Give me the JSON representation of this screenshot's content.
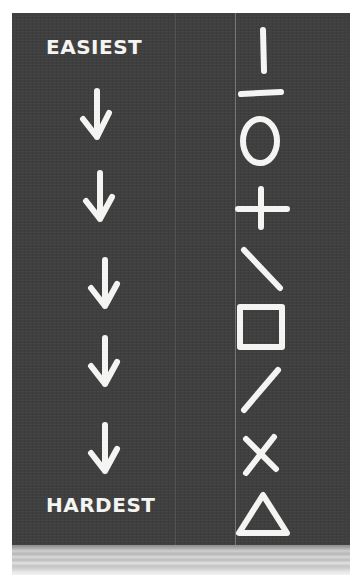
{
  "board": {
    "top_label": "EASIEST",
    "bottom_label": "HARDEST",
    "arrow_count": 5,
    "background_color": "#3f3f3f",
    "chalk_color": "#f4f4f2"
  },
  "symbols": [
    {
      "order": 1,
      "name": "vertical-line"
    },
    {
      "order": 2,
      "name": "horizontal-line"
    },
    {
      "order": 3,
      "name": "circle"
    },
    {
      "order": 4,
      "name": "cross-plus"
    },
    {
      "order": 5,
      "name": "diagonal-backslash"
    },
    {
      "order": 6,
      "name": "square"
    },
    {
      "order": 7,
      "name": "diagonal-slash"
    },
    {
      "order": 8,
      "name": "x-cross"
    },
    {
      "order": 9,
      "name": "triangle"
    }
  ]
}
